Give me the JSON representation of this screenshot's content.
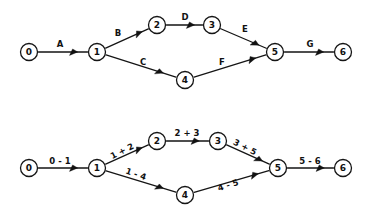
{
  "figure": {
    "background_color": "#ffffff",
    "ink_color": "#151515",
    "width": 366,
    "height": 215,
    "style": "hand-drawn activity-on-arrow network diagram"
  },
  "diagrams": [
    {
      "id": "top-network-diagram",
      "name": "activity-labelled-network",
      "label_style": "letters",
      "nodes": [
        {
          "id": "n0",
          "label": "0",
          "cx": 29,
          "cy": 52,
          "r": 8.5
        },
        {
          "id": "n1",
          "label": "1",
          "cx": 97,
          "cy": 52,
          "r": 8.5
        },
        {
          "id": "n2",
          "label": "2",
          "cx": 157,
          "cy": 25,
          "r": 8.5
        },
        {
          "id": "n3",
          "label": "3",
          "cx": 212,
          "cy": 25,
          "r": 8.5
        },
        {
          "id": "n4",
          "label": "4",
          "cx": 185,
          "cy": 80,
          "r": 8.5
        },
        {
          "id": "n5",
          "label": "5",
          "cx": 275,
          "cy": 52,
          "r": 8.5
        },
        {
          "id": "n6",
          "label": "6",
          "cx": 343,
          "cy": 52,
          "r": 8.5
        }
      ],
      "edges": [
        {
          "id": "e-a",
          "from": "n0",
          "to": "n1",
          "label": "A",
          "label_x": 60,
          "label_y": 44,
          "label_rotate": 0,
          "arrow_t": 0.8
        },
        {
          "id": "e-b",
          "from": "n1",
          "to": "n2",
          "label": "B",
          "label_x": 118,
          "label_y": 33,
          "label_rotate": 0,
          "arrow_t": 0.86
        },
        {
          "id": "e-c",
          "from": "n1",
          "to": "n4",
          "label": "C",
          "label_x": 143,
          "label_y": 62,
          "label_rotate": 0,
          "arrow_t": 0.82
        },
        {
          "id": "e-d",
          "from": "n2",
          "to": "n3",
          "label": "D",
          "label_x": 185,
          "label_y": 17,
          "label_rotate": 0,
          "arrow_t": 0.78
        },
        {
          "id": "e-e",
          "from": "n3",
          "to": "n5",
          "label": "E",
          "label_x": 245,
          "label_y": 29,
          "label_rotate": 0,
          "arrow_t": 0.84
        },
        {
          "id": "e-f",
          "from": "n4",
          "to": "n5",
          "label": "F",
          "label_x": 222,
          "label_y": 62,
          "label_rotate": 0,
          "arrow_t": 0.86
        },
        {
          "id": "e-g",
          "from": "n5",
          "to": "n6",
          "label": "G",
          "label_x": 310,
          "label_y": 44,
          "label_rotate": 0,
          "arrow_t": 0.8
        }
      ]
    },
    {
      "id": "bottom-network-diagram",
      "name": "event-numbered-network",
      "label_style": "node-pairs",
      "nodes": [
        {
          "id": "m0",
          "label": "0",
          "cx": 29,
          "cy": 168,
          "r": 8.5
        },
        {
          "id": "m1",
          "label": "1",
          "cx": 97,
          "cy": 168,
          "r": 8.5
        },
        {
          "id": "m2",
          "label": "2",
          "cx": 157,
          "cy": 141,
          "r": 8.5
        },
        {
          "id": "m3",
          "label": "3",
          "cx": 218,
          "cy": 141,
          "r": 8.5
        },
        {
          "id": "m4",
          "label": "4",
          "cx": 185,
          "cy": 195,
          "r": 8.5
        },
        {
          "id": "m5",
          "label": "5",
          "cx": 278,
          "cy": 168,
          "r": 8.5
        },
        {
          "id": "m6",
          "label": "6",
          "cx": 343,
          "cy": 168,
          "r": 8.5
        }
      ],
      "edges": [
        {
          "id": "f-01",
          "from": "m0",
          "to": "m1",
          "label": "0 - 1",
          "label_x": 60,
          "label_y": 161,
          "label_rotate": 0,
          "arrow_t": 0.8
        },
        {
          "id": "f-12",
          "from": "m1",
          "to": "m2",
          "label": "1 + 2",
          "label_x": 122,
          "label_y": 151,
          "label_rotate": -27,
          "arrow_t": 0.86
        },
        {
          "id": "f-23",
          "from": "m2",
          "to": "m3",
          "label": "2 + 3",
          "label_x": 187,
          "label_y": 133,
          "label_rotate": 0,
          "arrow_t": 0.78
        },
        {
          "id": "f-35",
          "from": "m3",
          "to": "m5",
          "label": "3 + 5",
          "label_x": 245,
          "label_y": 147,
          "label_rotate": 27,
          "arrow_t": 0.84
        },
        {
          "id": "f-14",
          "from": "m1",
          "to": "m4",
          "label": "1 - 4",
          "label_x": 136,
          "label_y": 174,
          "label_rotate": 19,
          "arrow_t": 0.82
        },
        {
          "id": "f-45",
          "from": "m4",
          "to": "m5",
          "label": "4 - 5",
          "label_x": 228,
          "label_y": 185,
          "label_rotate": -18,
          "arrow_t": 0.86
        },
        {
          "id": "f-56",
          "from": "m5",
          "to": "m6",
          "label": "5 - 6",
          "label_x": 310,
          "label_y": 161,
          "label_rotate": 0,
          "arrow_t": 0.8
        }
      ]
    }
  ]
}
